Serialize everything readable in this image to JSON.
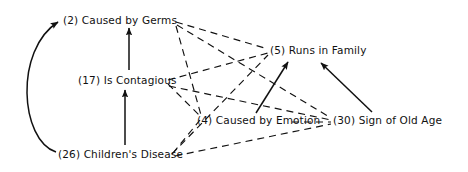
{
  "diagram": {
    "type": "concept-network",
    "title": "",
    "nodes": [
      {
        "id": "n2",
        "number": "(2)",
        "label": "Caused by Germs",
        "text": "(2) Caused by Germs"
      },
      {
        "id": "n5",
        "number": "(5)",
        "label": "Runs in  Family",
        "text": "(5) Runs in  Family"
      },
      {
        "id": "n17",
        "number": "(17)",
        "label": "Is Contagious",
        "text": "(17) Is Contagious"
      },
      {
        "id": "n4",
        "number": "(4)",
        "label": "Caused by Emotion",
        "text": "(4) Caused by Emotion"
      },
      {
        "id": "n30",
        "number": "(30)",
        "label": "Sign of Old Age",
        "text": "(30) Sign of Old Age"
      },
      {
        "id": "n26",
        "number": "(26)",
        "label": "Children's Disease",
        "text": "(26) Children's Disease"
      }
    ],
    "edges": [
      {
        "from": "n26",
        "to": "n2",
        "style": "solid-curved-arrow"
      },
      {
        "from": "n17",
        "to": "n2",
        "style": "solid-arrow"
      },
      {
        "from": "n26",
        "to": "n17",
        "style": "solid-arrow"
      },
      {
        "from": "n4",
        "to": "n5",
        "style": "solid-arrow"
      },
      {
        "from": "n30",
        "to": "n5",
        "style": "solid-arrow"
      },
      {
        "from": "n2",
        "to": "n5",
        "style": "dashed"
      },
      {
        "from": "n2",
        "to": "n4",
        "style": "dashed"
      },
      {
        "from": "n2",
        "to": "n30",
        "style": "dashed"
      },
      {
        "from": "n17",
        "to": "n5",
        "style": "dashed"
      },
      {
        "from": "n17",
        "to": "n4",
        "style": "dashed"
      },
      {
        "from": "n17",
        "to": "n30",
        "style": "dashed"
      },
      {
        "from": "n26",
        "to": "n5",
        "style": "dashed"
      },
      {
        "from": "n26",
        "to": "n4",
        "style": "dashed"
      },
      {
        "from": "n26",
        "to": "n30",
        "style": "dashed"
      },
      {
        "from": "n4",
        "to": "n30",
        "style": "dashed"
      }
    ],
    "colors": {
      "ink": "#111111",
      "background": "#ffffff"
    }
  }
}
